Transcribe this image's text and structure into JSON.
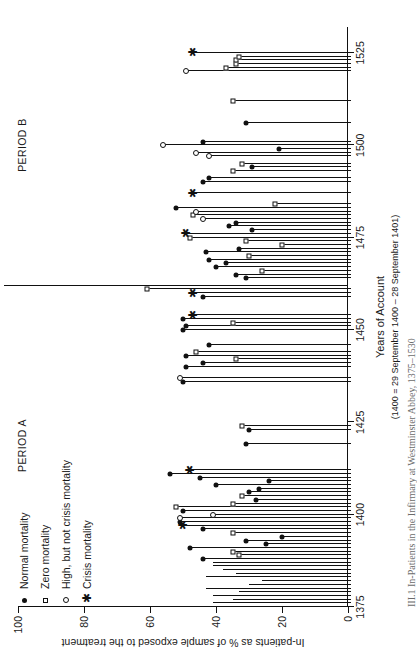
{
  "figure": {
    "caption": "III.1  In-Patients in the Infirmary at Westminster Abbey, 1375–1530",
    "xaxis": {
      "title": "Years of Account",
      "subtitle": "(1400 = 29 September 1400 – 28 September 1401)",
      "ticks": [
        "1375",
        "1400",
        "1425",
        "1450",
        "1475",
        "1500",
        "1525"
      ]
    },
    "yaxis": {
      "title": "In-patients as % of sample exposed to the treatment",
      "ticks": [
        "0",
        "20",
        "40",
        "60",
        "80",
        "100"
      ]
    },
    "periods": [
      {
        "label": "PERIOD A"
      },
      {
        "label": "PERIOD B"
      }
    ],
    "legend": [
      {
        "symbol": "filled-circle",
        "label": "Normal mortality"
      },
      {
        "symbol": "open-square",
        "label": "Zero mortality"
      },
      {
        "symbol": "open-circle",
        "label": "High, but not crisis mortality"
      },
      {
        "symbol": "asterisk",
        "label": "Crisis mortality"
      }
    ]
  },
  "chart_data": {
    "type": "bar",
    "title": "In-Patients in the Infirmary at Westminster Abbey, 1375–1530",
    "xlabel": "Years of Account",
    "ylabel": "In-patients as % of sample exposed to the treatment",
    "xlim": [
      1375,
      1532
    ],
    "ylim": [
      0,
      100
    ],
    "ytick_step": 20,
    "grid": false,
    "legend_position": "top-left",
    "marker_meaning": {
      "filled-circle": "Normal mortality",
      "open-square": "Zero mortality",
      "open-circle": "High, but not crisis mortality",
      "asterisk": "Crisis mortality"
    },
    "period_divider_year": 1462,
    "points": [
      {
        "year": 1375,
        "value": 42,
        "marker": "none"
      },
      {
        "year": 1376,
        "value": 41,
        "marker": "none"
      },
      {
        "year": 1377,
        "value": 35,
        "marker": "none"
      },
      {
        "year": 1378,
        "value": 41,
        "marker": "none"
      },
      {
        "year": 1379,
        "value": 33,
        "marker": "none"
      },
      {
        "year": 1380,
        "value": 43,
        "marker": "none"
      },
      {
        "year": 1381,
        "value": 30,
        "marker": "none"
      },
      {
        "year": 1382,
        "value": 26,
        "marker": "none"
      },
      {
        "year": 1383,
        "value": 43,
        "marker": "none"
      },
      {
        "year": 1384,
        "value": 34,
        "marker": "none"
      },
      {
        "year": 1385,
        "value": 38,
        "marker": "none"
      },
      {
        "year": 1386,
        "value": 41,
        "marker": "none"
      },
      {
        "year": 1387,
        "value": 41,
        "marker": "none"
      },
      {
        "year": 1388,
        "value": 44,
        "marker": "filled-circle"
      },
      {
        "year": 1389,
        "value": 33,
        "marker": "open-square"
      },
      {
        "year": 1390,
        "value": 35,
        "marker": "open-square"
      },
      {
        "year": 1391,
        "value": 48,
        "marker": "filled-circle"
      },
      {
        "year": 1392,
        "value": 25,
        "marker": "filled-circle"
      },
      {
        "year": 1393,
        "value": 31,
        "marker": "filled-circle"
      },
      {
        "year": 1394,
        "value": 20,
        "marker": "filled-circle"
      },
      {
        "year": 1395,
        "value": 35,
        "marker": "open-square"
      },
      {
        "year": 1396,
        "value": 44,
        "marker": "filled-circle"
      },
      {
        "year": 1397,
        "value": 50,
        "marker": "asterisk"
      },
      {
        "year": 1398,
        "value": 51,
        "marker": "filled-circle"
      },
      {
        "year": 1399,
        "value": 51,
        "marker": "open-circle"
      },
      {
        "year": 1400,
        "value": 41,
        "marker": "open-circle"
      },
      {
        "year": 1401,
        "value": 50,
        "marker": "filled-circle"
      },
      {
        "year": 1402,
        "value": 52,
        "marker": "open-square"
      },
      {
        "year": 1403,
        "value": 35,
        "marker": "open-square"
      },
      {
        "year": 1404,
        "value": 28,
        "marker": "filled-circle"
      },
      {
        "year": 1405,
        "value": 32,
        "marker": "open-square"
      },
      {
        "year": 1406,
        "value": 30,
        "marker": "filled-circle"
      },
      {
        "year": 1407,
        "value": 27,
        "marker": "filled-circle"
      },
      {
        "year": 1408,
        "value": 40,
        "marker": "filled-circle"
      },
      {
        "year": 1409,
        "value": 24,
        "marker": "filled-circle"
      },
      {
        "year": 1410,
        "value": 45,
        "marker": "filled-circle"
      },
      {
        "year": 1411,
        "value": 54,
        "marker": "filled-circle"
      },
      {
        "year": 1412,
        "value": 48,
        "marker": "asterisk"
      },
      {
        "year": 1419,
        "value": 31,
        "marker": "filled-circle"
      },
      {
        "year": 1423,
        "value": 30,
        "marker": "filled-circle"
      },
      {
        "year": 1424,
        "value": 32,
        "marker": "open-square"
      },
      {
        "year": 1436,
        "value": 50,
        "marker": "filled-circle"
      },
      {
        "year": 1437,
        "value": 51,
        "marker": "open-circle"
      },
      {
        "year": 1440,
        "value": 49,
        "marker": "filled-circle"
      },
      {
        "year": 1441,
        "value": 44,
        "marker": "filled-circle"
      },
      {
        "year": 1442,
        "value": 34,
        "marker": "open-square"
      },
      {
        "year": 1443,
        "value": 49,
        "marker": "filled-circle"
      },
      {
        "year": 1444,
        "value": 46,
        "marker": "open-square"
      },
      {
        "year": 1446,
        "value": 42,
        "marker": "filled-circle"
      },
      {
        "year": 1450,
        "value": 50,
        "marker": "filled-circle"
      },
      {
        "year": 1451,
        "value": 49,
        "marker": "filled-circle"
      },
      {
        "year": 1452,
        "value": 35,
        "marker": "open-square"
      },
      {
        "year": 1453,
        "value": 50,
        "marker": "filled-circle"
      },
      {
        "year": 1454,
        "value": 47,
        "marker": "asterisk"
      },
      {
        "year": 1459,
        "value": 44,
        "marker": "filled-circle"
      },
      {
        "year": 1460,
        "value": 47,
        "marker": "asterisk"
      },
      {
        "year": 1461,
        "value": 61,
        "marker": "open-square"
      },
      {
        "year": 1464,
        "value": 31,
        "marker": "filled-circle"
      },
      {
        "year": 1465,
        "value": 34,
        "marker": "filled-circle"
      },
      {
        "year": 1466,
        "value": 26,
        "marker": "open-square"
      },
      {
        "year": 1467,
        "value": 40,
        "marker": "filled-circle"
      },
      {
        "year": 1468,
        "value": 37,
        "marker": "filled-circle"
      },
      {
        "year": 1469,
        "value": 42,
        "marker": "filled-circle"
      },
      {
        "year": 1470,
        "value": 30,
        "marker": "open-square"
      },
      {
        "year": 1471,
        "value": 43,
        "marker": "filled-circle"
      },
      {
        "year": 1472,
        "value": 33,
        "marker": "filled-circle"
      },
      {
        "year": 1473,
        "value": 20,
        "marker": "open-square"
      },
      {
        "year": 1474,
        "value": 31,
        "marker": "open-square"
      },
      {
        "year": 1475,
        "value": 48,
        "marker": "open-square"
      },
      {
        "year": 1476,
        "value": 49,
        "marker": "asterisk"
      },
      {
        "year": 1477,
        "value": 29,
        "marker": "filled-circle"
      },
      {
        "year": 1478,
        "value": 36,
        "marker": "filled-circle"
      },
      {
        "year": 1479,
        "value": 34,
        "marker": "filled-circle"
      },
      {
        "year": 1480,
        "value": 44,
        "marker": "open-circle"
      },
      {
        "year": 1481,
        "value": 47,
        "marker": "open-square"
      },
      {
        "year": 1482,
        "value": 46,
        "marker": "open-circle"
      },
      {
        "year": 1483,
        "value": 52,
        "marker": "filled-circle"
      },
      {
        "year": 1484,
        "value": 22,
        "marker": "open-square"
      },
      {
        "year": 1487,
        "value": 47,
        "marker": "asterisk"
      },
      {
        "year": 1490,
        "value": 44,
        "marker": "filled-circle"
      },
      {
        "year": 1491,
        "value": 42,
        "marker": "filled-circle"
      },
      {
        "year": 1493,
        "value": 35,
        "marker": "open-square"
      },
      {
        "year": 1494,
        "value": 29,
        "marker": "filled-circle"
      },
      {
        "year": 1495,
        "value": 32,
        "marker": "open-square"
      },
      {
        "year": 1497,
        "value": 42,
        "marker": "open-circle"
      },
      {
        "year": 1498,
        "value": 46,
        "marker": "open-circle"
      },
      {
        "year": 1499,
        "value": 21,
        "marker": "filled-circle"
      },
      {
        "year": 1500,
        "value": 56,
        "marker": "open-circle"
      },
      {
        "year": 1501,
        "value": 44,
        "marker": "filled-circle"
      },
      {
        "year": 1506,
        "value": 31,
        "marker": "filled-circle"
      },
      {
        "year": 1512,
        "value": 35,
        "marker": "open-square"
      },
      {
        "year": 1520,
        "value": 49,
        "marker": "open-circle"
      },
      {
        "year": 1521,
        "value": 37,
        "marker": "open-square"
      },
      {
        "year": 1522,
        "value": 34,
        "marker": "open-square"
      },
      {
        "year": 1523,
        "value": 34,
        "marker": "open-square"
      },
      {
        "year": 1524,
        "value": 33,
        "marker": "open-square"
      },
      {
        "year": 1525,
        "value": 47,
        "marker": "asterisk"
      }
    ]
  }
}
